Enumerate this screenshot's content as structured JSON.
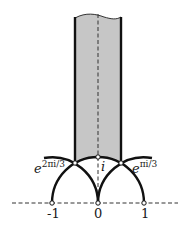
{
  "diagram": {
    "colors": {
      "fill": "#c6c6c6",
      "stroke": "#111111",
      "dashed": "#333333",
      "background": "#ffffff"
    },
    "geometry": {
      "origin_px": [
        98,
        203
      ],
      "unit_px": 46
    },
    "labels": {
      "corner_left_base": "e",
      "corner_left_exp": "2πi/3",
      "corner_right_base": "e",
      "corner_right_exp": "πi/3",
      "point_i": "i",
      "tick_neg1": "-1",
      "tick_0": "0",
      "tick_1": "1"
    },
    "points": [
      {
        "name": "-1",
        "x": -1,
        "y": 0
      },
      {
        "name": "0",
        "x": 0,
        "y": 0
      },
      {
        "name": "1",
        "x": 1,
        "y": 0
      },
      {
        "name": "i",
        "x": 0,
        "y": 1
      },
      {
        "name": "e^{2πi/3}",
        "x": -0.5,
        "y": 0.866
      },
      {
        "name": "e^{πi/3}",
        "x": 0.5,
        "y": 0.866
      }
    ]
  }
}
